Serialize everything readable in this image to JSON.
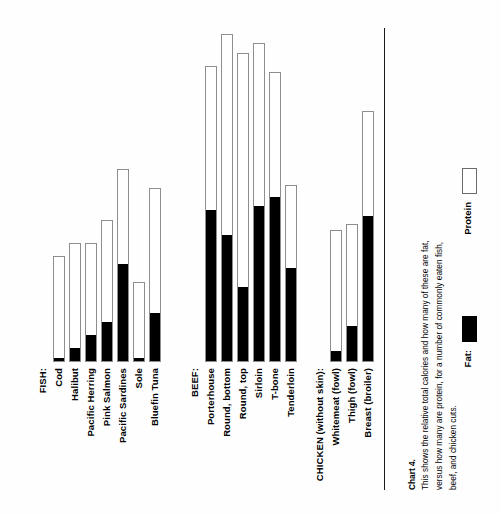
{
  "chart_data": {
    "type": "bar",
    "title": "",
    "subtitle": "",
    "xlabel": "",
    "ylabel": "",
    "stacked": true,
    "orientation": "vertical",
    "grid": false,
    "axis_visible": false,
    "legend_position": "right",
    "ylim": [
      0,
      100
    ],
    "units": "relative total calories",
    "series": [
      {
        "name": "Fat:",
        "color": "#000000"
      },
      {
        "name": "Protein",
        "color": "#ffffff"
      }
    ],
    "groups": [
      {
        "name": "FISH:",
        "items": [
          {
            "label": "Cod",
            "total": 33,
            "fat": 1,
            "protein": 32
          },
          {
            "label": "Halibut",
            "total": 37,
            "fat": 4,
            "protein": 33
          },
          {
            "label": "Pacific Herring",
            "total": 37,
            "fat": 8,
            "protein": 29
          },
          {
            "label": "Pink Salmon",
            "total": 44,
            "fat": 12,
            "protein": 32
          },
          {
            "label": "Pacific Sardines",
            "total": 60,
            "fat": 30,
            "protein": 30
          },
          {
            "label": "Sole",
            "total": 25,
            "fat": 1,
            "protein": 24
          },
          {
            "label": "Bluefin Tuna",
            "total": 54,
            "fat": 15,
            "protein": 39
          }
        ]
      },
      {
        "name": "BEEF:",
        "items": [
          {
            "label": "Porterhouse",
            "total": 92,
            "fat": 47,
            "protein": 45
          },
          {
            "label": "Round, bottom",
            "total": 102,
            "fat": 39,
            "protein": 63
          },
          {
            "label": "Round, top",
            "total": 96,
            "fat": 23,
            "protein": 73
          },
          {
            "label": "Sirloin",
            "total": 99,
            "fat": 48,
            "protein": 51
          },
          {
            "label": "T-bone",
            "total": 90,
            "fat": 51,
            "protein": 39
          },
          {
            "label": "Tenderloin",
            "total": 55,
            "fat": 29,
            "protein": 26
          }
        ]
      },
      {
        "name": "CHICKEN (without skin):",
        "items": [
          {
            "label": "Whitemeat (fowl)",
            "total": 41,
            "fat": 3,
            "protein": 38
          },
          {
            "label": "Thigh (fowl)",
            "total": 43,
            "fat": 11,
            "protein": 32
          },
          {
            "label": "Breast (broiler)",
            "total": 78,
            "fat": 45,
            "protein": 33
          }
        ]
      }
    ]
  },
  "groups": {
    "fish": {
      "heading": "FISH:",
      "labels": [
        "Cod",
        "Halibut",
        "Pacific Herring",
        "Pink Salmon",
        "Pacific Sardines",
        "Sole",
        "Bluefin Tuna"
      ]
    },
    "beef": {
      "heading": "BEEF:",
      "labels": [
        "Porterhouse",
        "Round, bottom",
        "Round, top",
        "Sirloin",
        "T-bone",
        "Tenderloin"
      ]
    },
    "chicken": {
      "heading": "CHICKEN (without skin):",
      "labels": [
        "Whitemeat (fowl)",
        "Thigh (fowl)",
        "Breast (broiler)"
      ]
    }
  },
  "legend": {
    "fat_label": "Fat:",
    "protein_label": "Protein",
    "fat_color": "#000000",
    "protein_color": "#ffffff"
  },
  "caption": {
    "number": "Chart 4.",
    "text": "This shows the relative total calories and how many of these are fat, versus how many are protein, for a number of commonly eaten fish, beef, and chicken cuts."
  }
}
